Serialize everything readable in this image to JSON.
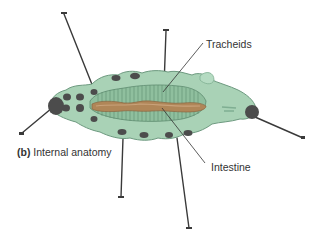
{
  "figure": {
    "caption_letter": "(b)",
    "caption_text": "Internal anatomy",
    "labels": [
      {
        "id": "tracheids",
        "text": "Tracheids"
      },
      {
        "id": "intestine",
        "text": "Intestine"
      }
    ]
  },
  "colors": {
    "body": "#a9d2b6",
    "body_dark": "#7fae92",
    "tracheid_region": "#8fbf9e",
    "intestine": "#b08658",
    "intestine_light": "#c9a27a",
    "nodules": "#4c4c4c",
    "pins": "#3a3a3a",
    "text": "#333333"
  }
}
